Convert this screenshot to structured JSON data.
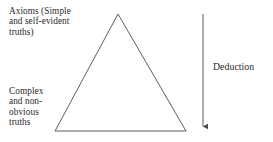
{
  "diagram": {
    "background_color": "#ffffff",
    "stroke_color": "#4a4a4a",
    "text_color": "#2b2b2b",
    "labels": {
      "top_left": "Axioms (Simple\nand self-evident\ntruths)",
      "bottom_left": "Complex\nand non-\nobvious\ntruths",
      "right": "Deduction"
    },
    "shapes": {
      "triangle": {
        "apex": [
          118,
          14
        ],
        "base_left": [
          55,
          131
        ],
        "base_right": [
          186,
          131
        ]
      },
      "arrow": {
        "x": 203,
        "y_start": 14,
        "y_end": 131,
        "direction": "down"
      }
    }
  }
}
